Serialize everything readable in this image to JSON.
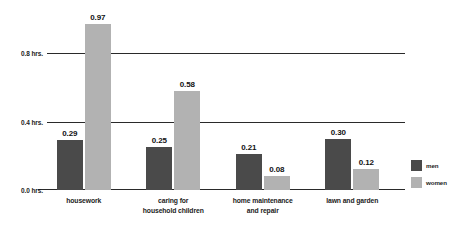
{
  "chart_data": {
    "type": "bar",
    "title": "",
    "xlabel": "",
    "ylabel": "",
    "ylim": [
      0.0,
      1.04
    ],
    "grid": true,
    "legend_position": "right",
    "categories": [
      "housework",
      "caring for household children",
      "home maintenance and repair",
      "lawn and garden"
    ],
    "category_lines": [
      [
        "housework"
      ],
      [
        "caring for",
        "household children"
      ],
      [
        "home maintenance",
        "and repair"
      ],
      [
        "lawn and garden"
      ]
    ],
    "series": [
      {
        "name": "men",
        "color": "#4a4a4a",
        "values": [
          0.29,
          0.25,
          0.21,
          0.3
        ],
        "labels": [
          "0.29",
          "0.25",
          "0.21",
          "0.30"
        ]
      },
      {
        "name": "women",
        "color": "#b2b2b2",
        "values": [
          0.97,
          0.58,
          0.08,
          0.12
        ],
        "labels": [
          "0.97",
          "0.58",
          "0.08",
          "0.12"
        ]
      }
    ],
    "yticks": [
      {
        "value": 0.8,
        "label": "0.8 hrs."
      },
      {
        "value": 0.4,
        "label": "0.4 hrs."
      },
      {
        "value": 0.0,
        "label": "0.0 hrs."
      }
    ]
  },
  "legend": {
    "items": [
      {
        "label": "men",
        "color": "#4a4a4a"
      },
      {
        "label": "women",
        "color": "#b2b2b2"
      }
    ]
  },
  "title_strip": {
    "text": ""
  }
}
